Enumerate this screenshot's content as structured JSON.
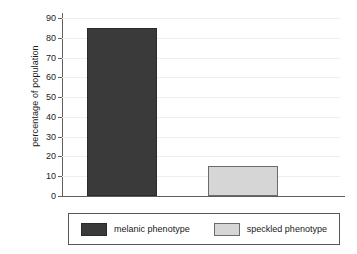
{
  "chart_data": {
    "type": "bar",
    "title": "",
    "xlabel": "",
    "ylabel": "percentage of population",
    "ylim": [
      0,
      92
    ],
    "yticks": [
      0,
      10,
      20,
      30,
      40,
      50,
      60,
      70,
      80,
      90
    ],
    "ytick_labels": [
      "0",
      "10",
      "20",
      "30",
      "40",
      "50",
      "60",
      "70",
      "80",
      "90"
    ],
    "grid": true,
    "legend_position": "bottom",
    "categories": [
      "melanic phenotype",
      "speckled phenotype"
    ],
    "values": [
      85,
      15
    ],
    "bars": [
      {
        "label": "melanic phenotype",
        "value": 85,
        "color": "#3a3a3a",
        "edge_color": "#2b2b2b"
      },
      {
        "label": "speckled phenotype",
        "value": 15,
        "color": "#d6d6d6",
        "edge_color": "#6b6b6b"
      }
    ],
    "legend": [
      {
        "label": "melanic phenotype",
        "color": "#3a3a3a"
      },
      {
        "label": "speckled phenotype",
        "color": "#d6d6d6"
      }
    ]
  },
  "colors": {
    "background": "#ffffff",
    "axis": "#5e5e5e",
    "gridline": "#efefef",
    "text": "#1a1a1a",
    "legend_border": "#585858",
    "melanic": "#3a3a3a",
    "speckled": "#d6d6d6"
  }
}
